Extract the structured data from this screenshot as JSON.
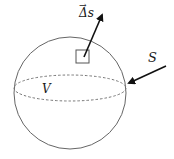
{
  "diagram": {
    "type": "sphere-surface-element",
    "labels": {
      "volume": "V",
      "surface": "S",
      "area_element": "Δs",
      "area_element_vector_mark": "→"
    },
    "colors": {
      "stroke": "#555555",
      "dashed": "#777777",
      "arrow": "#111111",
      "text": "#1a1a1a",
      "background": "#ffffff"
    }
  }
}
